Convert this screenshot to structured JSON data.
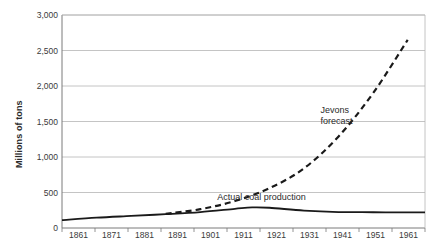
{
  "chart_data": {
    "type": "line",
    "title": "",
    "xlabel": "",
    "ylabel": "Millions of tons",
    "xlim": [
      1861,
      1966
    ],
    "ylim": [
      0,
      3000
    ],
    "grid": true,
    "legend_position": "inline-annotations",
    "x_ticks": [
      "1861",
      "1871",
      "1881",
      "1891",
      "1901",
      "1911",
      "1921",
      "1931",
      "1941",
      "1951",
      "1961"
    ],
    "y_ticks": [
      "0",
      "500",
      "1,000",
      "1,500",
      "2,000",
      "2,500",
      "3,000"
    ],
    "y_tick_values": [
      0,
      500,
      1000,
      1500,
      2000,
      2500,
      3000
    ],
    "series": [
      {
        "name": "Actual coal production",
        "style": "solid",
        "color": "#1a1a1a",
        "x": [
          1861,
          1871,
          1881,
          1891,
          1901,
          1911,
          1916,
          1921,
          1931,
          1941,
          1951,
          1961,
          1966
        ],
        "values": [
          110,
          145,
          170,
          195,
          225,
          270,
          290,
          285,
          245,
          225,
          222,
          220,
          220
        ]
      },
      {
        "name": "Jevons forecast",
        "style": "dashed",
        "color": "#1a1a1a",
        "x": [
          1891,
          1901,
          1911,
          1921,
          1931,
          1941,
          1951,
          1961
        ],
        "values": [
          200,
          265,
          380,
          560,
          840,
          1290,
          1900,
          2650
        ]
      }
    ],
    "annotations": [
      {
        "name": "jevons-forecast-label",
        "lines": [
          "Jevons",
          "forecast"
        ],
        "x": 1941,
        "y": 1650
      },
      {
        "name": "actual-production-label",
        "lines": [
          "Actual coal production"
        ],
        "x": 1936,
        "y": 430
      }
    ]
  },
  "colors": {
    "line": "#1a1a1a",
    "grid": "#b5b5b5",
    "axis": "#7a7a7a",
    "text": "#2b2b2b"
  }
}
